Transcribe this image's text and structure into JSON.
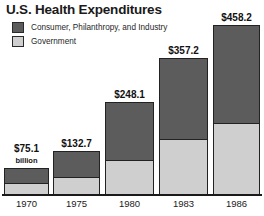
{
  "chart_data": {
    "type": "bar",
    "title": "U.S. Health Expenditures",
    "subtype": "stacked-bar",
    "xlabel": "",
    "ylabel": "",
    "unit_note": "billion",
    "grid": false,
    "legend_position": "top-left",
    "categories": [
      "1970",
      "1975",
      "1980",
      "1983",
      "1986"
    ],
    "totals": [
      75.1,
      132.7,
      248.1,
      357.2,
      458.2
    ],
    "total_labels": [
      "$75.1",
      "$132.7",
      "$248.1",
      "$357.2",
      "$458.2"
    ],
    "ylim": [
      0,
      458.2
    ],
    "series": [
      {
        "name": "Consumer, Philanthropy, and Industry",
        "color": "#5c5c5c",
        "values": [
          48.8,
          86.5,
          130.6,
          182.2,
          211.2
        ]
      },
      {
        "name": "Government",
        "color": "#cfcfcf",
        "values": [
          26.3,
          46.2,
          117.5,
          175.0,
          247.0
        ]
      }
    ]
  },
  "legend": {
    "items": [
      {
        "label": "Consumer, Philanthropy, and Industry",
        "swatch": "dark"
      },
      {
        "label": "Government",
        "swatch": "light"
      }
    ]
  },
  "axis": {
    "ticks": [
      "1970",
      "1975",
      "1980",
      "1983",
      "1986"
    ]
  },
  "bars": [
    {
      "year": "1970",
      "label": "$75.1",
      "unit": "billion",
      "x": 4,
      "w": 45,
      "top": 168,
      "split": 183
    },
    {
      "year": "1975",
      "label": "$132.7",
      "unit": "",
      "x": 53,
      "w": 47,
      "top": 151,
      "split": 177
    },
    {
      "year": "1980",
      "label": "$248.1",
      "unit": "",
      "x": 105,
      "w": 49,
      "top": 102,
      "split": 160
    },
    {
      "year": "1983",
      "label": "$357.2",
      "unit": "",
      "x": 159,
      "w": 49,
      "top": 58,
      "split": 139
    },
    {
      "year": "1986",
      "label": "$458.2",
      "unit": "",
      "x": 213,
      "w": 47,
      "top": 25,
      "split": 123
    }
  ],
  "colors": {
    "dark_segment": "#5c5c5c",
    "light_segment": "#cfcfcf",
    "outline": "#222222",
    "text": "#1a1a1a",
    "background": "#ffffff"
  }
}
